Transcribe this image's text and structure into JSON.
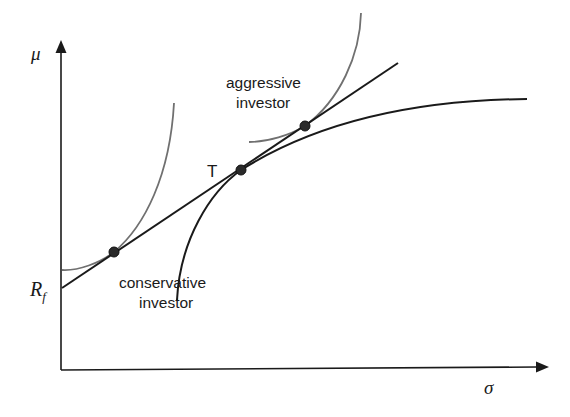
{
  "diagram": {
    "axes": {
      "y_label": "μ",
      "x_label": "σ",
      "rf_label_main": "R",
      "rf_label_sub": "f"
    },
    "labels": {
      "tangency": "T",
      "aggressive_line1": "aggressive",
      "aggressive_line2": "investor",
      "conservative_line1": "conservative",
      "conservative_line2": "investor"
    },
    "colors": {
      "axis": "#1a1a1a",
      "capital_market_line": "#1a1a1a",
      "efficient_frontier": "#1a1a1a",
      "indifference_curve": "#707070",
      "point": "#2a2a2a"
    },
    "points": [
      {
        "name": "conservative-optimum",
        "x": 114,
        "y": 252
      },
      {
        "name": "tangency-portfolio-T",
        "x": 241,
        "y": 170
      },
      {
        "name": "aggressive-optimum",
        "x": 305,
        "y": 126
      }
    ]
  }
}
